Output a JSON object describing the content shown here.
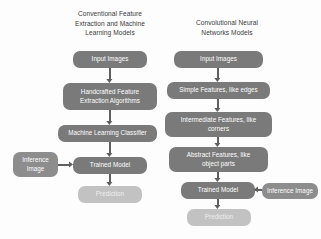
{
  "diagram": {
    "type": "flowchart",
    "background_color": "#fdfdfd",
    "columns": [
      {
        "id": "conventional",
        "title": "Conventional Feature\nExtraction and Machine\nLearning Models",
        "title_box": {
          "x": 52,
          "y": 9,
          "width": 116
        },
        "nodes": [
          {
            "id": "conv-input-images",
            "label": "Input Images",
            "style": "dark",
            "x": 73,
            "y": 51,
            "width": 74,
            "height": 17
          },
          {
            "id": "conv-handcrafted",
            "label": "Handcrafted Feature\nExtraction Algorithms",
            "style": "dark",
            "x": 63,
            "y": 83,
            "width": 94,
            "height": 27
          },
          {
            "id": "conv-ml-classifier",
            "label": "Machine Learning Classifier",
            "style": "dark",
            "x": 58,
            "y": 125,
            "width": 99,
            "height": 17
          },
          {
            "id": "conv-trained-model",
            "label": "Trained Model",
            "style": "dark",
            "x": 73,
            "y": 157,
            "width": 74,
            "height": 17
          },
          {
            "id": "conv-prediction",
            "label": "Prediction",
            "style": "light",
            "x": 78,
            "y": 186,
            "width": 64,
            "height": 17
          },
          {
            "id": "conv-inference-image",
            "label": "Inference\nImage",
            "style": "mid",
            "x": 13,
            "y": 152,
            "width": 45,
            "height": 25
          }
        ],
        "arrows": [
          {
            "id": "conv-arrow-1",
            "orientation": "vertical",
            "x": 110,
            "y": 68,
            "length": 15
          },
          {
            "id": "conv-arrow-2",
            "orientation": "vertical",
            "x": 110,
            "y": 110,
            "length": 15
          },
          {
            "id": "conv-arrow-3",
            "orientation": "vertical",
            "x": 110,
            "y": 142,
            "length": 15
          },
          {
            "id": "conv-arrow-4",
            "orientation": "vertical",
            "x": 110,
            "y": 174,
            "length": 12
          },
          {
            "id": "conv-arrow-inference",
            "orientation": "horizontal",
            "direction": "right",
            "x": 58,
            "y": 165,
            "length": 15
          }
        ]
      },
      {
        "id": "cnn",
        "title": "Convolutional Neural\nNetworks Models",
        "title_box": {
          "x": 174,
          "y": 18,
          "width": 106
        },
        "nodes": [
          {
            "id": "cnn-input-images",
            "label": "Input Images",
            "style": "dark",
            "x": 174,
            "y": 51,
            "width": 89,
            "height": 17
          },
          {
            "id": "cnn-simple-features",
            "label": "Simple Features, like edges",
            "style": "dark",
            "x": 167,
            "y": 82,
            "width": 103,
            "height": 17
          },
          {
            "id": "cnn-intermediate-features",
            "label": "Intermediate Features, like\ncorners",
            "style": "dark",
            "x": 165,
            "y": 112,
            "width": 107,
            "height": 25
          },
          {
            "id": "cnn-abstract-features",
            "label": "Abstract Features, like\nobject parts",
            "style": "dark",
            "x": 169,
            "y": 147,
            "width": 99,
            "height": 25
          },
          {
            "id": "cnn-trained-model",
            "label": "Trained Model",
            "style": "dark",
            "x": 181,
            "y": 182,
            "width": 74,
            "height": 17
          },
          {
            "id": "cnn-prediction",
            "label": "Prediction",
            "style": "light",
            "x": 187,
            "y": 209,
            "width": 64,
            "height": 17
          },
          {
            "id": "cnn-inference-image",
            "label": "Inference Image",
            "style": "mid",
            "x": 262,
            "y": 183,
            "width": 56,
            "height": 16
          }
        ],
        "arrows": [
          {
            "id": "cnn-arrow-1",
            "orientation": "vertical",
            "x": 218,
            "y": 68,
            "length": 14
          },
          {
            "id": "cnn-arrow-2",
            "orientation": "vertical",
            "x": 218,
            "y": 99,
            "length": 13
          },
          {
            "id": "cnn-arrow-3",
            "orientation": "vertical",
            "x": 218,
            "y": 137,
            "length": 10
          },
          {
            "id": "cnn-arrow-4",
            "orientation": "vertical",
            "x": 218,
            "y": 172,
            "length": 10
          },
          {
            "id": "cnn-arrow-5",
            "orientation": "vertical",
            "x": 218,
            "y": 199,
            "length": 10
          },
          {
            "id": "cnn-arrow-inference",
            "orientation": "horizontal",
            "direction": "left",
            "x": 255,
            "y": 190,
            "length": 7
          }
        ]
      }
    ],
    "colors": {
      "node_dark": "#7a7a7a",
      "node_mid": "#8d8d8d",
      "node_light": "#c2c2c2",
      "arrow": "#5f5f5f",
      "title_text": "#3a3a3a",
      "node_text": "#ffffff"
    }
  }
}
